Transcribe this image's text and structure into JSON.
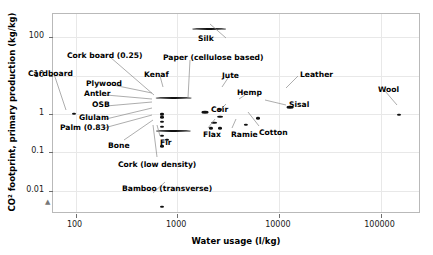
{
  "chart_data": {
    "type": "scatter",
    "title": "",
    "xlabel": "Water usage (l/kg)",
    "ylabel": "CO² footprint, primary production (kg/kg)",
    "xscale": "log",
    "yscale": "log",
    "xlim": [
      60,
      250000
    ],
    "ylim": [
      0.0025,
      400
    ],
    "grid": true,
    "legend": "none",
    "xticks": [
      {
        "value": 100,
        "label": "100"
      },
      {
        "value": 1000,
        "label": "1000"
      },
      {
        "value": 10000,
        "label": "10000"
      },
      {
        "value": 100000,
        "label": "100000"
      }
    ],
    "yticks": [
      {
        "value": 100,
        "label": "100"
      },
      {
        "value": 10,
        "label": "10"
      },
      {
        "value": 1,
        "label": "1"
      },
      {
        "value": 0.1,
        "label": "0.1"
      },
      {
        "value": 0.01,
        "label": "0.01"
      }
    ],
    "points": [
      {
        "name": "Silk",
        "x": 2000,
        "y": 160,
        "xlo": 1400,
        "xhi": 3000,
        "label": "Silk",
        "lx": 198,
        "ly": 35,
        "anchor": "start"
      },
      {
        "name": "Paper (cellulose based)",
        "x": 1900,
        "y": 1.1,
        "xlo": 1750,
        "xhi": 2050,
        "label": "Paper (cellulose based)",
        "lx": 163,
        "ly": 54,
        "anchor": "start"
      },
      {
        "name": "Cork board (0.25)",
        "x": 700,
        "y": 1.0,
        "xlo": 690,
        "xhi": 720,
        "label": "Cork board (0.25)",
        "lx": 67,
        "ly": 52,
        "anchor": "start"
      },
      {
        "name": "Cardboard",
        "x": 95,
        "y": 1.0,
        "xlo": 92,
        "xhi": 100,
        "label": "Cardboard",
        "lx": 28,
        "ly": 70,
        "anchor": "start"
      },
      {
        "name": "Kenaf",
        "x": 900,
        "y": 2.6,
        "xlo": 610,
        "xhi": 1400,
        "label": "Kenaf",
        "lx": 144,
        "ly": 71,
        "anchor": "start"
      },
      {
        "name": "Jute",
        "x": 2600,
        "y": 1.3,
        "xlo": 2500,
        "xhi": 2750,
        "label": "Jute",
        "lx": 222,
        "ly": 72,
        "anchor": "start"
      },
      {
        "name": "Leather",
        "x": 13000,
        "y": 1.5,
        "xlo": 12000,
        "xhi": 14000,
        "label": "Leather",
        "lx": 300,
        "ly": 71,
        "anchor": "start"
      },
      {
        "name": "Wool",
        "x": 150000,
        "y": 0.95,
        "xlo": 145000,
        "xhi": 158000,
        "label": "Wool",
        "lx": 378,
        "ly": 86,
        "anchor": "start"
      },
      {
        "name": "Plywood",
        "x": 700,
        "y": 0.95,
        "xlo": 690,
        "xhi": 715,
        "label": "Plywood",
        "lx": 86,
        "ly": 80,
        "anchor": "start"
      },
      {
        "name": "Antler",
        "x": 705,
        "y": 0.82,
        "xlo": 690,
        "xhi": 720,
        "label": "Antler",
        "lx": 84,
        "ly": 90,
        "anchor": "start"
      },
      {
        "name": "Hemp",
        "x": 2600,
        "y": 0.85,
        "xlo": 2450,
        "xhi": 2800,
        "label": "Hemp",
        "lx": 237,
        "ly": 89,
        "anchor": "start"
      },
      {
        "name": "Sisal",
        "x": 6200,
        "y": 0.78,
        "xlo": 6000,
        "xhi": 6500,
        "label": "Sisal",
        "lx": 289,
        "ly": 101,
        "anchor": "start"
      },
      {
        "name": "OSB",
        "x": 700,
        "y": 0.62,
        "xlo": 688,
        "xhi": 715,
        "label": "OSB",
        "lx": 92,
        "ly": 101,
        "anchor": "start"
      },
      {
        "name": "Coir",
        "x": 2300,
        "y": 0.6,
        "xlo": 2150,
        "xhi": 2450,
        "label": "Coir",
        "lx": 211,
        "ly": 106,
        "anchor": "start"
      },
      {
        "name": "Glulam",
        "x": 700,
        "y": 0.46,
        "xlo": 690,
        "xhi": 715,
        "label": "Glulam",
        "lx": 79,
        "ly": 114,
        "anchor": "start"
      },
      {
        "name": "Palm (0.83)",
        "x": 900,
        "y": 0.36,
        "xlo": 620,
        "xhi": 1350,
        "label": "Palm (0.83)",
        "lx": 60,
        "ly": 124,
        "anchor": "start"
      },
      {
        "name": "Flax",
        "x": 2150,
        "y": 0.42,
        "xlo": 2050,
        "xhi": 2250,
        "label": "Flax",
        "lx": 203,
        "ly": 131,
        "anchor": "start"
      },
      {
        "name": "Ramie",
        "x": 2650,
        "y": 0.42,
        "xlo": 2550,
        "xhi": 2780,
        "label": "Ramie",
        "lx": 231,
        "ly": 131,
        "anchor": "start"
      },
      {
        "name": "Cotton",
        "x": 4700,
        "y": 0.52,
        "xlo": 4500,
        "xhi": 4950,
        "label": "Cotton",
        "lx": 259,
        "ly": 129,
        "anchor": "start"
      },
      {
        "name": "Bone",
        "x": 710,
        "y": 0.27,
        "xlo": 700,
        "xhi": 725,
        "label": "Bone",
        "lx": 108,
        "ly": 142,
        "anchor": "start"
      },
      {
        "name": "Fir",
        "x": 790,
        "y": 0.21,
        "xlo": 775,
        "xhi": 810,
        "label": "Fir",
        "lx": 160,
        "ly": 139,
        "anchor": "start"
      },
      {
        "name": "Cork (low density)",
        "x": 700,
        "y": 0.145,
        "xlo": 690,
        "xhi": 715,
        "label": "Cork (low density)",
        "lx": 118,
        "ly": 161,
        "anchor": "start"
      },
      {
        "name": "Bamboo (transverse)",
        "x": 700,
        "y": 0.0038,
        "xlo": 690,
        "xhi": 720,
        "label": "Bamboo (transverse)",
        "lx": 122,
        "ly": 185,
        "anchor": "start"
      }
    ],
    "leaders": [
      {
        "from": [
          54,
          74
        ],
        "to": [
          66,
          110
        ]
      },
      {
        "from": [
          110,
          57
        ],
        "to": [
          154,
          95
        ]
      },
      {
        "from": [
          113,
          85
        ],
        "to": [
          152,
          93
        ]
      },
      {
        "from": [
          106,
          95
        ],
        "to": [
          152,
          99
        ]
      },
      {
        "from": [
          106,
          106
        ],
        "to": [
          152,
          102
        ]
      },
      {
        "from": [
          106,
          119
        ],
        "to": [
          152,
          108
        ]
      },
      {
        "from": [
          104,
          128
        ],
        "to": [
          152,
          115
        ]
      },
      {
        "from": [
          160,
          76
        ],
        "to": [
          163,
          87
        ]
      },
      {
        "from": [
          190,
          60
        ],
        "to": [
          188,
          98
        ]
      },
      {
        "from": [
          210,
          24
        ],
        "to": [
          226,
          38
        ]
      },
      {
        "from": [
          228,
          78
        ],
        "to": [
          222,
          87
        ]
      },
      {
        "from": [
          245,
          95
        ],
        "to": [
          239,
          99
        ]
      },
      {
        "from": [
          218,
          112
        ],
        "to": [
          226,
          104
        ]
      },
      {
        "from": [
          208,
          128
        ],
        "to": [
          215,
          119
        ]
      },
      {
        "from": [
          232,
          128
        ],
        "to": [
          236,
          119
        ]
      },
      {
        "from": [
          286,
          105
        ],
        "to": [
          265,
          100
        ]
      },
      {
        "from": [
          259,
          126
        ],
        "to": [
          248,
          112
        ]
      },
      {
        "from": [
          298,
          76
        ],
        "to": [
          286,
          88
        ]
      },
      {
        "from": [
          385,
          91
        ],
        "to": [
          397,
          105
        ]
      },
      {
        "from": [
          124,
          140
        ],
        "to": [
          153,
          120
        ]
      },
      {
        "from": [
          160,
          136
        ],
        "to": [
          157,
          125
        ]
      },
      {
        "from": [
          157,
          157
        ],
        "to": [
          153,
          125
        ]
      },
      {
        "from": [
          165,
          182
        ],
        "to": [
          153,
          193
        ]
      }
    ]
  }
}
